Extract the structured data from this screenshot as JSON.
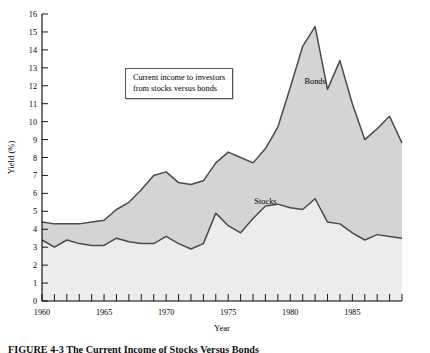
{
  "figure": {
    "caption_label": "FIGURE 4-3",
    "caption_text": "The Current Income of Stocks Versus Bonds"
  },
  "annotation": {
    "line1": "Current income to investors",
    "line2": "from stocks versus bonds"
  },
  "colors": {
    "bonds_fill": "#d4d4d4",
    "stocks_fill": "#ececec",
    "line": "#4a4a4a",
    "axis": "#000000"
  },
  "chart_data": {
    "type": "area",
    "title": "",
    "xlabel": "Year",
    "ylabel": "Yield (%)",
    "xlim": [
      1960,
      1989
    ],
    "ylim": [
      0,
      16
    ],
    "ytick_step": 1,
    "yticks": [
      0,
      1,
      2,
      3,
      4,
      5,
      6,
      7,
      8,
      9,
      10,
      11,
      12,
      13,
      14,
      15,
      16
    ],
    "xticks_major": [
      1960,
      1965,
      1970,
      1975,
      1980,
      1985
    ],
    "xtick_step_minor": 1,
    "grid": false,
    "legend": "inline-labels",
    "legend_entries": [
      "Bonds",
      "Stocks"
    ],
    "x": [
      1960,
      1961,
      1962,
      1963,
      1964,
      1965,
      1966,
      1967,
      1968,
      1969,
      1970,
      1971,
      1972,
      1973,
      1974,
      1975,
      1976,
      1977,
      1978,
      1979,
      1980,
      1981,
      1982,
      1983,
      1984,
      1985,
      1986,
      1987,
      1988,
      1989
    ],
    "series": [
      {
        "name": "Bonds",
        "label_x": 1982,
        "label_y": 12.1,
        "values": [
          4.4,
          4.3,
          4.3,
          4.3,
          4.4,
          4.5,
          5.1,
          5.5,
          6.2,
          7.0,
          7.2,
          6.6,
          6.5,
          6.7,
          7.7,
          8.3,
          8.0,
          7.7,
          8.5,
          9.7,
          11.9,
          14.2,
          15.3,
          11.8,
          13.4,
          11.0,
          9.0,
          9.6,
          10.3,
          8.8
        ]
      },
      {
        "name": "Stocks",
        "label_x": 1978,
        "label_y": 5.4,
        "values": [
          3.4,
          3.0,
          3.4,
          3.2,
          3.1,
          3.1,
          3.5,
          3.3,
          3.2,
          3.2,
          3.6,
          3.2,
          2.9,
          3.2,
          4.9,
          4.2,
          3.8,
          4.6,
          5.3,
          5.4,
          5.2,
          5.1,
          5.7,
          4.4,
          4.3,
          3.8,
          3.4,
          3.7,
          3.6,
          3.5
        ]
      }
    ]
  }
}
